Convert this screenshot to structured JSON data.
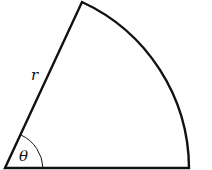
{
  "diagram": {
    "type": "circular-sector",
    "labels": {
      "radius": "r",
      "angle": "θ"
    },
    "colors": {
      "stroke": "#111111",
      "background": "#ffffff"
    }
  }
}
